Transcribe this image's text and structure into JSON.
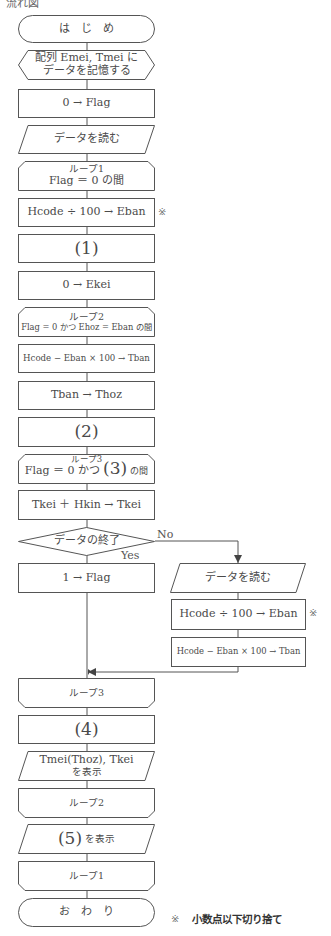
{
  "header": {
    "title": "流れ図"
  },
  "flowchart": {
    "start": "は　じ　め",
    "prep": [
      "配列 Emei, Tmei に",
      "データを記憶する"
    ],
    "init_flag": "0 → Flag",
    "read1": "データを読む",
    "loop1_start": [
      "ループ1",
      "Flag ＝ 0 の間"
    ],
    "calc_eban1": "Hcode ÷ 100 → Eban",
    "blank1": "(1)",
    "init_ekei": "0 → Ekei",
    "loop2_start": [
      "ループ2",
      "Flag = 0 かつ Ehoz = Eban の間"
    ],
    "calc_tban1": "Hcode − Eban × 100 → Tban",
    "tban_thoz": "Tban → Thoz",
    "blank2": "(2)",
    "loop3_start": [
      "ループ3",
      "Flag ＝ 0 かつ",
      "(3)",
      "の間"
    ],
    "add_tkei": "Tkei ＋ Hkin → Tkei",
    "decision": "データの終了",
    "decision_no": "No",
    "decision_yes": "Yes",
    "set_flag": "1 → Flag",
    "read2": "データを読む",
    "calc_eban2": "Hcode ÷ 100 → Eban",
    "calc_tban2": "Hcode − Eban × 100 → Tban",
    "loop3_end": "ループ3",
    "blank4": "(4)",
    "output1": [
      "Tmei(Thoz), Tkei",
      "を表示"
    ],
    "loop2_end": "ループ2",
    "output2": [
      "(5)",
      "を表示"
    ],
    "loop1_end": "ループ1",
    "end": "お　わ　り"
  },
  "notes": {
    "mark": "※",
    "footnote_mark": "※",
    "footnote_text": "小数点以下切り捨て"
  },
  "colors": {
    "line": "#555555",
    "text": "#4a4a4a",
    "background": "#ffffff"
  }
}
